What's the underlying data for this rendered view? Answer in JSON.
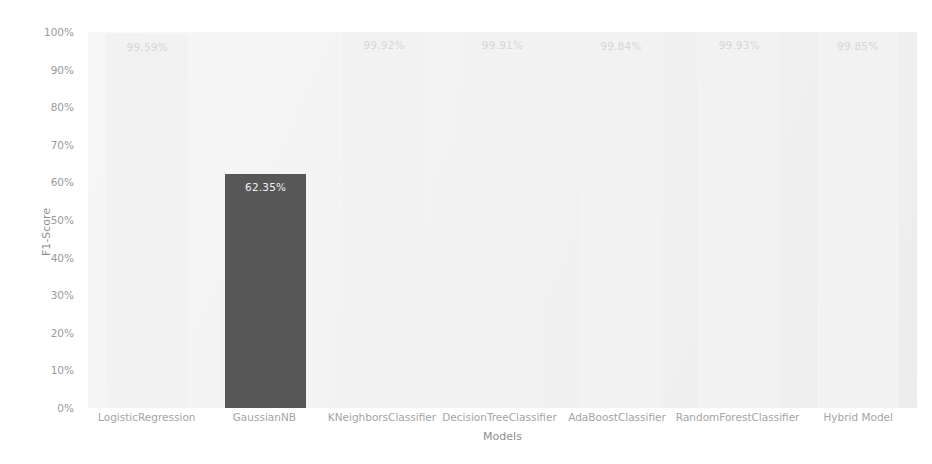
{
  "chart_data": {
    "type": "bar",
    "title": "",
    "xlabel": "Models",
    "ylabel": "F1-Score",
    "ylim": [
      0,
      100
    ],
    "grid": false,
    "legend": "none",
    "categories": [
      "LogisticRegression",
      "GaussianNB",
      "KNeighborsClassifier",
      "DecisionTreeClassifier",
      "AdaBoostClassifier",
      "RandomForestClassifier",
      "Hybrid Model"
    ],
    "values": [
      99.59,
      62.35,
      99.92,
      99.91,
      99.84,
      99.93,
      99.85
    ],
    "value_labels": [
      "99.59%",
      "62.35%",
      "99.92%",
      "99.91%",
      "99.84%",
      "99.93%",
      "99.85%"
    ],
    "bar_colors": [
      "#f2f2f2",
      "#575757",
      "#f2f2f2",
      "#f2f2f2",
      "#f2f2f2",
      "#f2f2f2",
      "#f2f2f2"
    ],
    "label_colors": [
      "#d6d6d6",
      "#f0f0f0",
      "#d6d6d6",
      "#d6d6d6",
      "#d6d6d6",
      "#d6d6d6",
      "#d6d6d6"
    ],
    "ytick_labels": [
      "100%",
      "90%",
      "80%",
      "70%",
      "60%",
      "50%",
      "40%",
      "30%",
      "20%",
      "10%",
      "0%"
    ],
    "ytick_values": [
      100,
      90,
      80,
      70,
      60,
      50,
      40,
      30,
      20,
      10,
      0
    ],
    "plot_background": "#f3f3f3",
    "figure_background": "#ffffff",
    "axis_text_color": "#9a9a9a"
  }
}
